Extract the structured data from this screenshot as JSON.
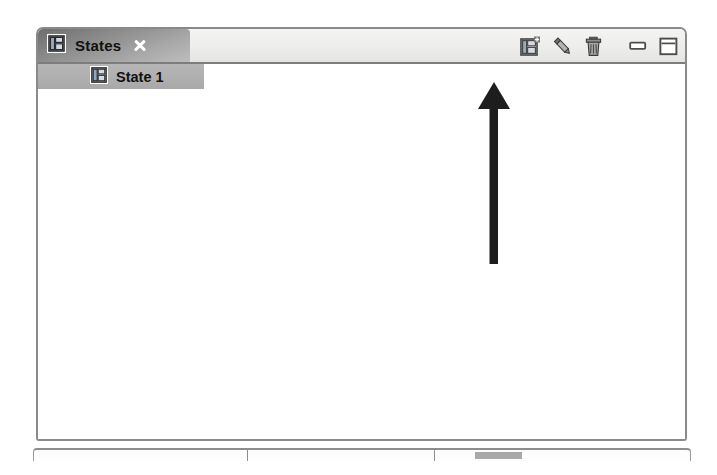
{
  "window": {
    "panel_name": "States view panel",
    "background_color": "#ffffff",
    "border_color": "#8a8a8a"
  },
  "tab": {
    "label": "States",
    "icon": "view-panel-icon",
    "close_icon": "close-icon",
    "active": true
  },
  "toolbar": {
    "buttons": [
      {
        "name": "new-state-button",
        "icon": "new-view-panel-icon",
        "tooltip": "New State"
      },
      {
        "name": "edit-state-button",
        "icon": "pencil-icon",
        "tooltip": "Edit State"
      },
      {
        "name": "delete-state-button",
        "icon": "trash-icon",
        "tooltip": "Delete State"
      }
    ],
    "window_controls": [
      {
        "name": "minimize-button",
        "icon": "minimize-icon"
      },
      {
        "name": "maximize-button",
        "icon": "maximize-icon"
      }
    ]
  },
  "tree": {
    "items": [
      {
        "label": "State 1",
        "icon": "view-panel-icon",
        "selected": true
      }
    ],
    "selection_color": "#b0b0b0"
  },
  "annotation": {
    "type": "arrow",
    "direction": "up",
    "color": "#1d1d1d",
    "points_to": "new-state-button"
  },
  "status_bar": {
    "cells": [
      "",
      "",
      ""
    ],
    "progress_visible": true
  }
}
